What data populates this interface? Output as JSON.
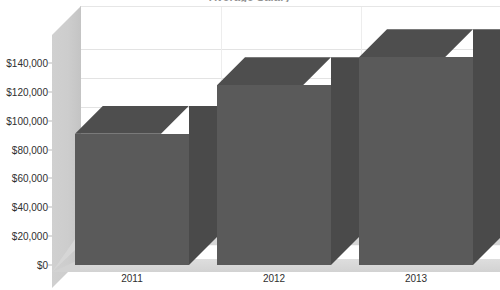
{
  "chart_data": {
    "type": "bar",
    "title": "Average Salary",
    "categories": [
      "2011",
      "2012",
      "2013"
    ],
    "values": [
      91000,
      124500,
      144000
    ],
    "value_labels": [
      "$91,000",
      "$124,500",
      "$144,000"
    ],
    "xlabel": "",
    "ylabel": "",
    "ylim": [
      0,
      145000
    ],
    "y_ticks": [
      0,
      20000,
      40000,
      60000,
      80000,
      100000,
      120000,
      140000
    ],
    "y_tick_labels": [
      "$0",
      "$20,000",
      "$40,000",
      "$60,000",
      "$80,000",
      "$100,000",
      "$120,000",
      "$140,000"
    ],
    "grid": true,
    "legend": false,
    "legend_position": "none",
    "style": "3d-column"
  },
  "colors": {
    "bar_front": "#5a5a5a",
    "bar_top": "#4e4e4e",
    "bar_side": "#4a4a4a",
    "plot_background": "#ffffff",
    "wall": "#cdcdcd",
    "floor": "#d6d6d6",
    "gridline": "#e3e3e3",
    "text": "#2f2f2f"
  },
  "axes": {
    "y": {
      "ticks": [
        {
          "label": "$140,000",
          "value": 140000
        },
        {
          "label": "$120,000",
          "value": 120000
        },
        {
          "label": "$100,000",
          "value": 100000
        },
        {
          "label": "$80,000",
          "value": 80000
        },
        {
          "label": "$60,000",
          "value": 60000
        },
        {
          "label": "$40,000",
          "value": 40000
        },
        {
          "label": "$20,000",
          "value": 20000
        },
        {
          "label": "$0",
          "value": 0
        }
      ]
    },
    "x": {
      "ticks": [
        {
          "label": "2011"
        },
        {
          "label": "2012"
        },
        {
          "label": "2013"
        }
      ]
    }
  }
}
